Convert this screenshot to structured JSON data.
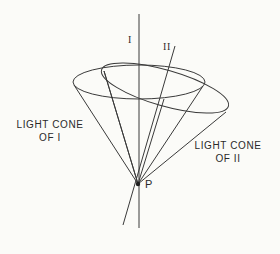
{
  "diagram": {
    "axis_labels": {
      "worldline_1": "I",
      "worldline_2": "II"
    },
    "point_label": "P",
    "cone_labels": {
      "cone_1_line1": "LIGHT CONE",
      "cone_1_line2": "OF I",
      "cone_2_line1": "LIGHT CONE",
      "cone_2_line2": "OF II"
    },
    "colors": {
      "line": "#3a3a3a",
      "background": "#fbfbf8"
    }
  }
}
